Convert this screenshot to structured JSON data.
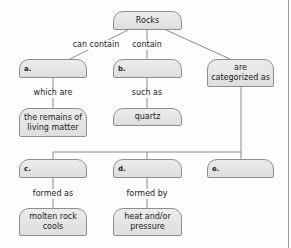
{
  "diagram": {
    "type": "concept-map",
    "root": {
      "label": "Rocks"
    },
    "nodes": {
      "a": {
        "label": "a."
      },
      "b": {
        "label": "b."
      },
      "categorized": {
        "label": "are categorized as"
      },
      "remains": {
        "label": "the remains of living matter"
      },
      "quartz": {
        "label": "quartz"
      },
      "c": {
        "label": "c."
      },
      "d": {
        "label": "d."
      },
      "e": {
        "label": "e."
      },
      "molten": {
        "label": "molten rock cools"
      },
      "heat": {
        "label": "heat and/or pressure"
      }
    },
    "links": {
      "can_contain": "can contain",
      "contain": "contain",
      "which_are": "which are",
      "such_as": "such as",
      "formed_as": "formed as",
      "formed_by": "formed by"
    },
    "colors": {
      "node_fill": "#e4e4e4",
      "node_border": "#8e8e8e",
      "line": "#8a8a8a",
      "text": "#222222"
    }
  }
}
